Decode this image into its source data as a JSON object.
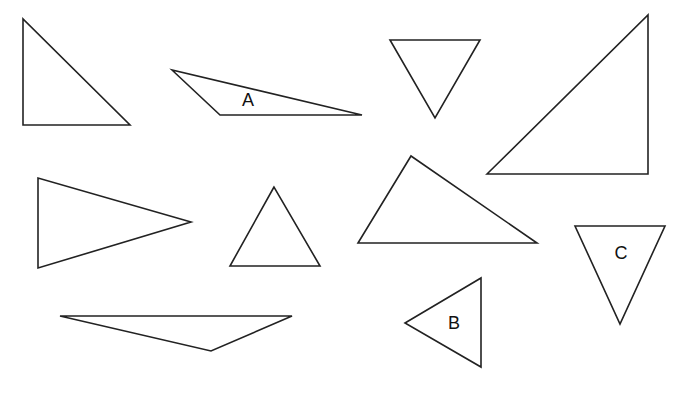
{
  "line_color": "#222222",
  "background": "#ffffff",
  "triangles": [
    {
      "id": "t1",
      "label": ""
    },
    {
      "id": "tA",
      "label": "A"
    },
    {
      "id": "t3",
      "label": ""
    },
    {
      "id": "t4",
      "label": ""
    },
    {
      "id": "t5",
      "label": ""
    },
    {
      "id": "t6",
      "label": ""
    },
    {
      "id": "t7",
      "label": ""
    },
    {
      "id": "tC",
      "label": "C"
    },
    {
      "id": "tB",
      "label": "B"
    },
    {
      "id": "t10",
      "label": ""
    }
  ]
}
